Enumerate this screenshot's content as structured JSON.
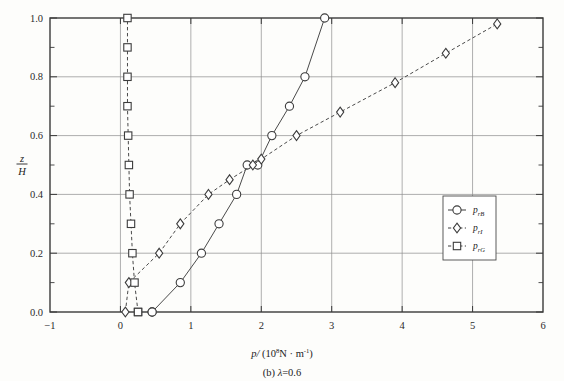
{
  "figure": {
    "caption_prefix": "(b)",
    "caption_symbol": "λ",
    "caption_value": "=0.6",
    "caption_full": "(b) λ=0.6"
  },
  "chart_data": {
    "type": "line",
    "title": "",
    "subtitle": "",
    "xlabel": "p/ (10⁸N · m⁻¹)",
    "xlabel_parts": {
      "symbol": "p/",
      "unit_open": "(10",
      "unit_exp": "8",
      "unit_mid": "N · m",
      "unit_exp2": "-1",
      "unit_close": ")"
    },
    "ylabel": "z/H",
    "ylabel_parts": {
      "numerator": "z",
      "denominator": "H"
    },
    "xlim": [
      -1,
      6
    ],
    "ylim": [
      0.0,
      1.0
    ],
    "xticks": [
      -1,
      0,
      1,
      2,
      3,
      4,
      5,
      6
    ],
    "xticklabels": [
      "−1",
      "0",
      "1",
      "2",
      "3",
      "4",
      "5",
      "6"
    ],
    "yticks": [
      0.0,
      0.2,
      0.4,
      0.6,
      0.8,
      1.0
    ],
    "yticklabels": [
      "0.0",
      "0.2",
      "0.4",
      "0.6",
      "0.8",
      "1.0"
    ],
    "yminorticks": [
      0.1,
      0.3,
      0.5,
      0.7,
      0.9
    ],
    "grid": true,
    "grid_x": [
      0,
      1,
      2,
      3,
      4,
      5
    ],
    "grid_y": [
      0.2,
      0.4,
      0.6,
      0.8
    ],
    "legend_position": "center-right",
    "series": [
      {
        "name": "p_rB",
        "label_base": "p",
        "label_sub": "rB",
        "marker": "circle",
        "linestyle": "solid",
        "color": "#4a4a4a",
        "x": [
          0.45,
          0.45,
          0.85,
          1.15,
          1.4,
          1.65,
          1.8,
          1.95,
          2.15,
          2.4,
          2.62,
          2.9
        ],
        "y": [
          0.0,
          0.0,
          0.1,
          0.2,
          0.3,
          0.4,
          0.5,
          0.5,
          0.6,
          0.7,
          0.8,
          1.0
        ]
      },
      {
        "name": "p_rI",
        "label_base": "p",
        "label_sub": "rI",
        "marker": "diamond",
        "linestyle": "dashed",
        "color": "#4a4a4a",
        "x": [
          0.07,
          0.12,
          0.55,
          0.85,
          1.25,
          1.55,
          1.88,
          2.0,
          2.5,
          3.12,
          3.9,
          4.62,
          5.35
        ],
        "y": [
          0.0,
          0.1,
          0.2,
          0.3,
          0.4,
          0.45,
          0.5,
          0.52,
          0.6,
          0.68,
          0.78,
          0.88,
          0.98
        ]
      },
      {
        "name": "p_rG",
        "label_base": "p",
        "label_sub": "rG",
        "marker": "square",
        "linestyle": "dashed",
        "color": "#4a4a4a",
        "x": [
          0.25,
          0.25,
          0.2,
          0.17,
          0.15,
          0.13,
          0.12,
          0.11,
          0.1,
          0.1,
          0.1,
          0.1
        ],
        "y": [
          0.0,
          0.0,
          0.1,
          0.2,
          0.3,
          0.4,
          0.5,
          0.6,
          0.7,
          0.8,
          0.9,
          1.0
        ]
      }
    ],
    "legend": [
      {
        "label": "p",
        "sub": "rB",
        "marker": "circle",
        "linestyle": "solid"
      },
      {
        "label": "p",
        "sub": "rI",
        "marker": "diamond",
        "linestyle": "dashed"
      },
      {
        "label": "p",
        "sub": "rG",
        "marker": "square",
        "linestyle": "dashed"
      }
    ]
  }
}
